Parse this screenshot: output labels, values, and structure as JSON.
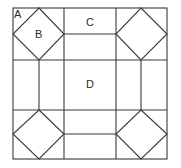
{
  "diagram": {
    "type": "quilt-block-grid",
    "stroke_color": "#3a3a3a",
    "background": "#ffffff",
    "labels": {
      "a": "A",
      "b": "B",
      "c": "C",
      "d": "D"
    }
  }
}
